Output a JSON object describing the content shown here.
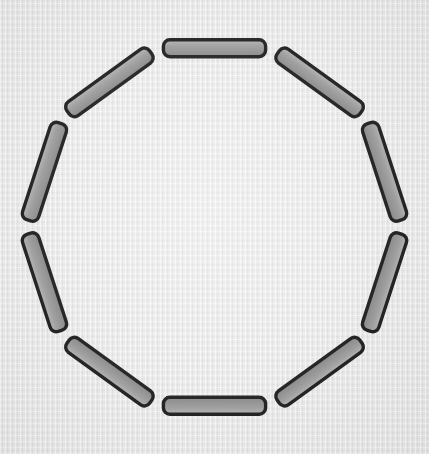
{
  "figure": {
    "title": "Regular decagon outline",
    "shape_name": "decagon",
    "sides": 10,
    "canvas": {
      "width": 429,
      "height": 454
    },
    "background": {
      "color": "#e9e9e9",
      "texture": "woven-linen"
    },
    "geometry": {
      "center_x": 214.5,
      "center_y": 227.0,
      "circumradius": 188.0,
      "start_angle_deg": -108.0,
      "interior_angle_deg": 144.0,
      "exterior_angle_deg": 36.0,
      "vertex_count": 10,
      "segment_thickness": 17.0,
      "segment_shrink": 7.0,
      "corner_radius": 6.5
    },
    "style": {
      "fill_color": "#969696",
      "fill_highlight": "#b0b0b0",
      "fill_shadow": "#7e7e7e",
      "stroke_color": "#141414",
      "stroke_width": 3.4
    },
    "segments": [
      {
        "index": 0,
        "label": "segment-top",
        "angle_deg": 90
      },
      {
        "index": 1,
        "label": "segment-upper-right",
        "angle_deg": 54
      },
      {
        "index": 2,
        "label": "segment-right-upper",
        "angle_deg": 18
      },
      {
        "index": 3,
        "label": "segment-right-lower",
        "angle_deg": 342
      },
      {
        "index": 4,
        "label": "segment-lower-right",
        "angle_deg": 306
      },
      {
        "index": 5,
        "label": "segment-bottom",
        "angle_deg": 270
      },
      {
        "index": 6,
        "label": "segment-lower-left",
        "angle_deg": 234
      },
      {
        "index": 7,
        "label": "segment-left-lower",
        "angle_deg": 198
      },
      {
        "index": 8,
        "label": "segment-left-upper",
        "angle_deg": 162
      },
      {
        "index": 9,
        "label": "segment-upper-left",
        "angle_deg": 126
      }
    ]
  }
}
